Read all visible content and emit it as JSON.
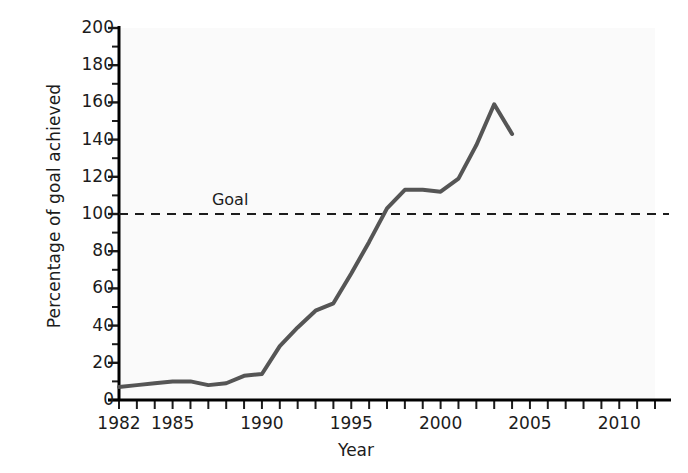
{
  "chart_data": {
    "type": "line",
    "title": "",
    "xlabel": "Year",
    "ylabel": "Percentage of goal achieved",
    "xlim": [
      1982,
      2012
    ],
    "ylim": [
      0,
      200
    ],
    "grid": false,
    "legend": "none",
    "y_major_ticks": [
      0,
      20,
      40,
      60,
      80,
      100,
      120,
      140,
      160,
      180,
      200
    ],
    "y_minor_ticks": [
      10,
      30,
      50,
      70,
      90,
      110,
      130,
      150,
      170,
      190
    ],
    "y_tick_labels": [
      "0",
      "20",
      "40",
      "60",
      "80",
      "100",
      "120",
      "140",
      "160",
      "180",
      "200"
    ],
    "x_major_ticks": [
      1982,
      1985,
      1990,
      1995,
      2000,
      2005,
      2010
    ],
    "x_tick_labels": [
      "1982",
      "1985",
      "1990",
      "1995",
      "2000",
      "2005",
      "2010"
    ],
    "x_minor_ticks": [
      1983,
      1984,
      1986,
      1987,
      1988,
      1989,
      1991,
      1992,
      1993,
      1994,
      1996,
      1997,
      1998,
      1999,
      2001,
      2002,
      2003,
      2004,
      2006,
      2007,
      2008,
      2009,
      2011,
      2012
    ],
    "series": [
      {
        "name": "Percentage of goal achieved",
        "color": "#555555",
        "line_width": 4,
        "x": [
          1982,
          1983,
          1984,
          1985,
          1986,
          1987,
          1988,
          1989,
          1990,
          1991,
          1992,
          1993,
          1994,
          1995,
          1996,
          1997,
          1998,
          1999,
          2000,
          2001,
          2002,
          2003,
          2004
        ],
        "values": [
          7,
          8,
          9,
          10,
          10,
          8,
          9,
          13,
          14,
          29,
          39,
          48,
          52,
          68,
          85,
          103,
          113,
          113,
          112,
          119,
          137,
          159,
          143
        ]
      }
    ],
    "reference_lines": [
      {
        "label": "Goal",
        "value": 100,
        "style": "dashed",
        "color": "#1c1c1c",
        "label_x": 1987.2
      }
    ]
  }
}
